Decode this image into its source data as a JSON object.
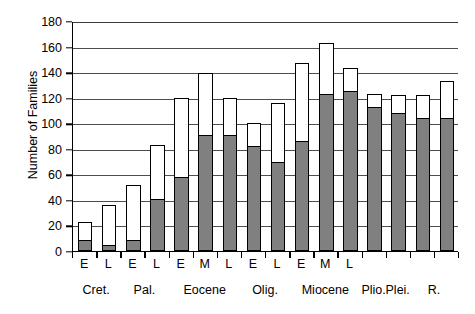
{
  "chart_data": {
    "type": "bar",
    "title": "",
    "subtitle": "",
    "xlabel": "",
    "ylabel": "Number of Families",
    "ylim": [
      0,
      180
    ],
    "ytick_step": 20,
    "yticks": [
      0,
      20,
      40,
      60,
      80,
      100,
      120,
      140,
      160,
      180
    ],
    "grid": "horizontal",
    "stacked": true,
    "legend": "none",
    "legend_position": "none",
    "colors": {
      "lower_segment": "#808080",
      "upper_segment": "#ffffff",
      "outline": "#000000",
      "gridline": "#4d4d4d",
      "axis": "#000000",
      "background": "#ffffff"
    },
    "categories": [
      "E",
      "L",
      "E",
      "L",
      "E",
      "M",
      "L",
      "E",
      "L",
      "E",
      "M",
      "L",
      "",
      "",
      "",
      ""
    ],
    "groups": [
      {
        "label": "Cret.",
        "span": 2
      },
      {
        "label": "Pal.",
        "span": 2
      },
      {
        "label": "Eocene",
        "span": 3
      },
      {
        "label": "Olig.",
        "span": 2
      },
      {
        "label": "Miocene",
        "span": 3
      },
      {
        "label": "Plio.",
        "span": 1
      },
      {
        "label": "Plei.",
        "span": 1
      },
      {
        "label": "R.",
        "span": 2
      }
    ],
    "series": [
      {
        "name": "lower-shaded",
        "values": [
          9,
          5,
          9,
          41,
          58,
          91,
          91,
          82,
          70,
          86,
          123,
          125,
          113,
          108,
          104,
          104
        ]
      },
      {
        "name": "upper-open",
        "values": [
          14,
          31,
          43,
          42,
          62,
          48,
          29,
          18,
          46,
          61,
          40,
          18,
          10,
          14,
          18,
          29
        ]
      }
    ],
    "totals": [
      23,
      36,
      52,
      83,
      120,
      139,
      120,
      100,
      116,
      147,
      163,
      143,
      123,
      122,
      122,
      133
    ]
  }
}
